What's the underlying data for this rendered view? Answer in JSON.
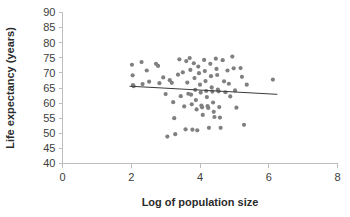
{
  "chart_data": {
    "type": "scatter",
    "title": "",
    "xlabel": "Log of population size",
    "ylabel": "Life expectancy (years)",
    "xlim": [
      0,
      8
    ],
    "ylim": [
      40,
      90
    ],
    "xticks": [
      0,
      2,
      4,
      6,
      8
    ],
    "yticks": [
      40,
      45,
      50,
      55,
      60,
      65,
      70,
      75,
      80,
      85,
      90
    ],
    "xtick_labels": [
      "0",
      "2",
      "4",
      "6",
      "8"
    ],
    "ytick_labels": [
      "40",
      "45",
      "50",
      "55",
      "60",
      "65",
      "70",
      "75",
      "80",
      "85",
      "90"
    ],
    "grid": false,
    "legend": null,
    "point_color": "#808080",
    "trendline_color": "#3a3a3a",
    "axis_color": "#bdbdbd",
    "marker_radius": 2.1,
    "trendline": {
      "type": "linear",
      "x_start": 1.95,
      "y_start": 65.6,
      "x_end": 6.25,
      "y_end": 62.9
    },
    "points": [
      [
        2.02,
        72.7
      ],
      [
        2.04,
        69.2
      ],
      [
        2.05,
        66.0
      ],
      [
        2.07,
        65.6
      ],
      [
        2.3,
        73.6
      ],
      [
        2.33,
        66.3
      ],
      [
        2.45,
        70.8
      ],
      [
        2.52,
        67.1
      ],
      [
        2.72,
        73.0
      ],
      [
        2.78,
        72.3
      ],
      [
        2.82,
        66.6
      ],
      [
        2.93,
        68.5
      ],
      [
        3.0,
        63.0
      ],
      [
        3.05,
        48.9
      ],
      [
        3.12,
        67.6
      ],
      [
        3.18,
        66.7
      ],
      [
        3.22,
        60.3
      ],
      [
        3.25,
        55.0
      ],
      [
        3.28,
        49.7
      ],
      [
        3.36,
        69.4
      ],
      [
        3.4,
        74.5
      ],
      [
        3.44,
        62.3
      ],
      [
        3.5,
        70.2
      ],
      [
        3.54,
        58.9
      ],
      [
        3.58,
        51.3
      ],
      [
        3.6,
        73.9
      ],
      [
        3.63,
        66.8
      ],
      [
        3.66,
        63.1
      ],
      [
        3.7,
        74.9
      ],
      [
        3.72,
        71.0
      ],
      [
        3.74,
        62.8
      ],
      [
        3.76,
        59.6
      ],
      [
        3.78,
        51.2
      ],
      [
        3.82,
        73.2
      ],
      [
        3.84,
        68.3
      ],
      [
        3.86,
        64.4
      ],
      [
        3.88,
        61.0
      ],
      [
        3.9,
        57.9
      ],
      [
        3.92,
        51.0
      ],
      [
        3.95,
        72.1
      ],
      [
        3.97,
        69.9
      ],
      [
        4.0,
        66.1
      ],
      [
        4.02,
        63.5
      ],
      [
        4.04,
        59.2
      ],
      [
        4.06,
        58.6
      ],
      [
        4.08,
        56.1
      ],
      [
        4.12,
        74.3
      ],
      [
        4.14,
        70.6
      ],
      [
        4.16,
        67.3
      ],
      [
        4.18,
        64.0
      ],
      [
        4.2,
        62.0
      ],
      [
        4.22,
        59.0
      ],
      [
        4.24,
        58.4
      ],
      [
        4.26,
        51.8
      ],
      [
        4.3,
        73.0
      ],
      [
        4.32,
        68.9
      ],
      [
        4.34,
        65.2
      ],
      [
        4.36,
        63.8
      ],
      [
        4.38,
        60.2
      ],
      [
        4.4,
        57.1
      ],
      [
        4.42,
        55.4
      ],
      [
        4.46,
        74.7
      ],
      [
        4.48,
        71.3
      ],
      [
        4.5,
        69.3
      ],
      [
        4.52,
        64.5
      ],
      [
        4.54,
        63.9
      ],
      [
        4.56,
        58.7
      ],
      [
        4.58,
        55.2
      ],
      [
        4.6,
        51.8
      ],
      [
        4.66,
        74.2
      ],
      [
        4.7,
        67.2
      ],
      [
        4.74,
        63.6
      ],
      [
        4.8,
        70.8
      ],
      [
        4.84,
        66.4
      ],
      [
        4.88,
        62.2
      ],
      [
        4.94,
        75.4
      ],
      [
        4.98,
        71.5
      ],
      [
        5.02,
        64.2
      ],
      [
        5.06,
        58.5
      ],
      [
        5.18,
        71.6
      ],
      [
        5.22,
        68.7
      ],
      [
        5.28,
        52.8
      ],
      [
        5.36,
        66.1
      ],
      [
        6.12,
        67.8
      ]
    ]
  }
}
